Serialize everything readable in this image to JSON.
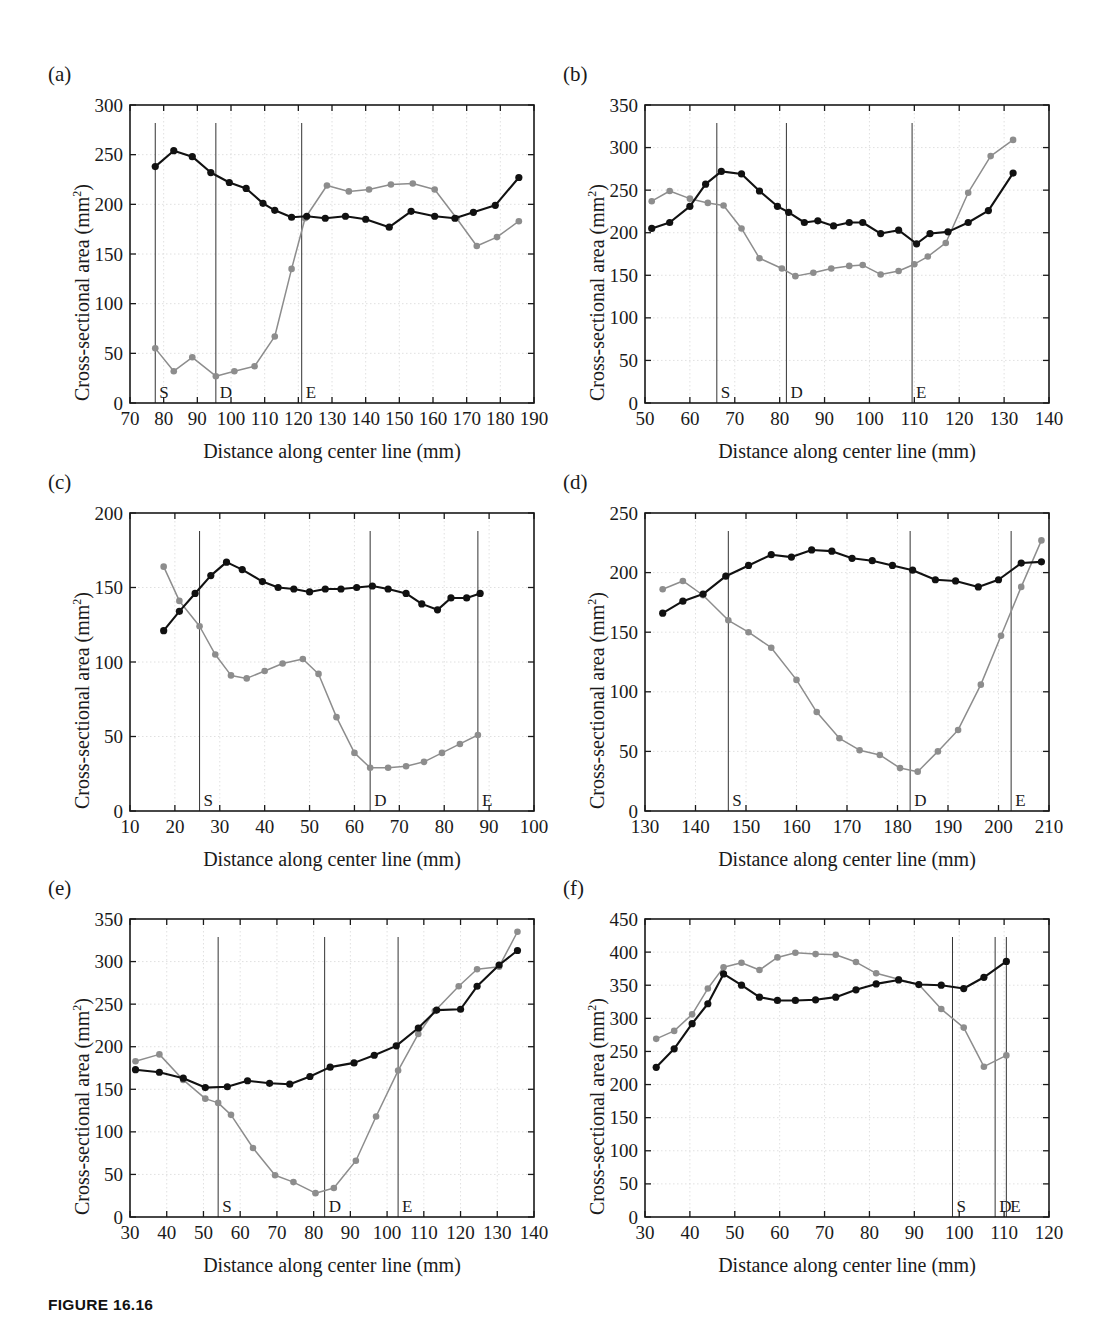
{
  "figure": {
    "caption": "FIGURE 16.16",
    "axis_title_x": "Distance along center line (mm)",
    "axis_title_y_main": "Cross-sectional area (mm",
    "axis_title_y_sup": "2",
    "axis_title_y_close": ")",
    "colors": {
      "series_black": "#111111",
      "series_gray": "#8d8d8d",
      "axis": "#1a1a1a",
      "grid": "#d8d8d8",
      "background": "#ffffff"
    },
    "marker_labels": {
      "start": "S",
      "disease": "D",
      "end": "E"
    }
  },
  "chart_data": [
    {
      "id": "a",
      "panel_label": "(a)",
      "type": "line",
      "title": "",
      "xlabel": "Distance along center line (mm)",
      "ylabel": "Cross-sectional area (mm2)",
      "xlim": [
        70,
        190
      ],
      "ylim": [
        0,
        300
      ],
      "xticks": [
        70,
        80,
        90,
        100,
        110,
        120,
        130,
        140,
        150,
        160,
        170,
        180,
        190
      ],
      "yticks": [
        0,
        50,
        100,
        150,
        200,
        250,
        300
      ],
      "grid": true,
      "legend": "none",
      "markers": [
        {
          "label": "S",
          "x": 77.5
        },
        {
          "label": "D",
          "x": 95.5
        },
        {
          "label": "E",
          "x": 121.0
        }
      ],
      "series": [
        {
          "name": "black",
          "color": "#111111",
          "x": [
            77.5,
            83.0,
            88.5,
            94.0,
            99.5,
            104.5,
            109.5,
            113.0,
            118.0,
            122.5,
            128.0,
            134.0,
            140.0,
            147.0,
            153.5,
            160.5,
            166.5,
            172.0,
            178.5,
            185.5
          ],
          "y": [
            238,
            254,
            248,
            232,
            222,
            216,
            201,
            194,
            187,
            188,
            186,
            188,
            185,
            177,
            193,
            188,
            186,
            192,
            199,
            227
          ]
        },
        {
          "name": "gray",
          "color": "#8d8d8d",
          "x": [
            77.5,
            83.0,
            88.5,
            95.5,
            101.0,
            107.0,
            113.0,
            118.0,
            122.0,
            128.5,
            135.0,
            141.0,
            147.5,
            154.0,
            160.5,
            167.0,
            173.0,
            179.0,
            185.5
          ],
          "y": [
            55,
            32,
            46,
            27,
            32,
            37,
            67,
            135,
            186,
            219,
            213,
            215,
            220,
            221,
            215,
            186,
            158,
            167,
            183
          ]
        }
      ]
    },
    {
      "id": "b",
      "panel_label": "(b)",
      "type": "line",
      "xlabel": "Distance along center line (mm)",
      "ylabel": "Cross-sectional area (mm2)",
      "xlim": [
        50,
        140
      ],
      "ylim": [
        0,
        350
      ],
      "xticks": [
        50,
        60,
        70,
        80,
        90,
        100,
        110,
        120,
        130,
        140
      ],
      "yticks": [
        0,
        50,
        100,
        150,
        200,
        250,
        300,
        350
      ],
      "grid": true,
      "legend": "none",
      "markers": [
        {
          "label": "S",
          "x": 66.0
        },
        {
          "label": "D",
          "x": 81.5
        },
        {
          "label": "E",
          "x": 109.5
        }
      ],
      "series": [
        {
          "name": "black",
          "color": "#111111",
          "x": [
            51.5,
            55.5,
            60.0,
            63.5,
            67.0,
            71.5,
            75.5,
            79.5,
            82.0,
            85.5,
            88.5,
            92.0,
            95.5,
            98.5,
            102.5,
            106.5,
            110.5,
            113.5,
            117.5,
            122.0,
            126.5,
            132.0
          ],
          "y": [
            205,
            212,
            231,
            257,
            272,
            269,
            249,
            231,
            224,
            212,
            214,
            208,
            212,
            212,
            199,
            203,
            187,
            199,
            201,
            212,
            226,
            270
          ]
        },
        {
          "name": "gray",
          "color": "#8d8d8d",
          "x": [
            51.5,
            55.5,
            60.0,
            64.0,
            67.5,
            71.5,
            75.5,
            80.5,
            83.5,
            87.5,
            91.5,
            95.5,
            98.5,
            102.5,
            106.5,
            110.0,
            113.0,
            117.0,
            122.0,
            127.0,
            132.0
          ],
          "y": [
            237,
            249,
            240,
            235,
            232,
            205,
            170,
            158,
            149,
            153,
            158,
            161,
            162,
            151,
            155,
            163,
            172,
            188,
            247,
            290,
            309
          ]
        }
      ]
    },
    {
      "id": "c",
      "panel_label": "(c)",
      "type": "line",
      "xlabel": "Distance along center line (mm)",
      "ylabel": "Cross-sectional area (mm2)",
      "xlim": [
        10,
        100
      ],
      "ylim": [
        0,
        200
      ],
      "xticks": [
        10,
        20,
        30,
        40,
        50,
        60,
        70,
        80,
        90,
        100
      ],
      "yticks": [
        0,
        50,
        100,
        150,
        200
      ],
      "grid": true,
      "legend": "none",
      "markers": [
        {
          "label": "S",
          "x": 25.5
        },
        {
          "label": "D",
          "x": 63.5
        },
        {
          "label": "E",
          "x": 87.5
        }
      ],
      "series": [
        {
          "name": "black",
          "color": "#111111",
          "x": [
            17.5,
            21.0,
            24.5,
            28.0,
            31.5,
            35.0,
            39.5,
            43.0,
            46.5,
            50.0,
            53.5,
            57.0,
            60.5,
            64.0,
            67.5,
            71.5,
            75.0,
            78.5,
            81.5,
            85.0,
            88.0
          ],
          "y": [
            121,
            134,
            146,
            158,
            167,
            162,
            154,
            150,
            149,
            147,
            149,
            149,
            150,
            151,
            149,
            146,
            139,
            135,
            143,
            143,
            146
          ]
        },
        {
          "name": "gray",
          "color": "#8d8d8d",
          "x": [
            17.5,
            21.0,
            25.5,
            29.0,
            32.5,
            36.0,
            40.0,
            44.0,
            48.5,
            52.0,
            56.0,
            60.0,
            63.5,
            67.5,
            71.5,
            75.5,
            79.5,
            83.5,
            87.5
          ],
          "y": [
            164,
            141,
            124,
            105,
            91,
            89,
            94,
            99,
            102,
            92,
            63,
            39,
            29,
            29,
            30,
            33,
            39,
            45,
            51
          ]
        }
      ]
    },
    {
      "id": "d",
      "panel_label": "(d)",
      "type": "line",
      "xlabel": "Distance along center line (mm)",
      "ylabel": "Cross-sectional area (mm2)",
      "xlim": [
        130,
        210
      ],
      "ylim": [
        0,
        250
      ],
      "xticks": [
        130,
        140,
        150,
        160,
        170,
        180,
        190,
        200,
        210
      ],
      "yticks": [
        0,
        50,
        100,
        150,
        200,
        250
      ],
      "grid": true,
      "legend": "none",
      "markers": [
        {
          "label": "S",
          "x": 146.5
        },
        {
          "label": "D",
          "x": 182.5
        },
        {
          "label": "E",
          "x": 202.5
        }
      ],
      "series": [
        {
          "name": "black",
          "color": "#111111",
          "x": [
            133.5,
            137.5,
            141.5,
            146.0,
            150.5,
            155.0,
            159.0,
            163.0,
            167.0,
            171.0,
            175.0,
            179.0,
            183.0,
            187.5,
            191.5,
            196.0,
            200.0,
            204.5,
            208.5
          ],
          "y": [
            166,
            176,
            182,
            197,
            206,
            215,
            213,
            219,
            218,
            212,
            210,
            206,
            202,
            194,
            193,
            188,
            194,
            208,
            209
          ]
        },
        {
          "name": "gray",
          "color": "#8d8d8d",
          "x": [
            133.5,
            137.5,
            141.5,
            146.5,
            150.5,
            155.0,
            160.0,
            164.0,
            168.5,
            172.5,
            176.5,
            180.5,
            184.0,
            188.0,
            192.0,
            196.5,
            200.5,
            204.5,
            208.5
          ],
          "y": [
            186,
            193,
            181,
            160,
            150,
            137,
            110,
            83,
            61,
            51,
            47,
            36,
            33,
            50,
            68,
            106,
            147,
            188,
            227
          ]
        }
      ]
    },
    {
      "id": "e",
      "panel_label": "(e)",
      "type": "line",
      "xlabel": "Distance along center line (mm)",
      "ylabel": "Cross-sectional area (mm2)",
      "xlim": [
        30,
        140
      ],
      "ylim": [
        0,
        350
      ],
      "xticks": [
        30,
        40,
        50,
        60,
        70,
        80,
        90,
        100,
        110,
        120,
        130,
        140
      ],
      "yticks": [
        0,
        50,
        100,
        150,
        200,
        250,
        300,
        350
      ],
      "grid": true,
      "legend": "none",
      "markers": [
        {
          "label": "S",
          "x": 54.0
        },
        {
          "label": "D",
          "x": 83.0
        },
        {
          "label": "E",
          "x": 103.0
        }
      ],
      "series": [
        {
          "name": "black",
          "color": "#111111",
          "x": [
            31.5,
            38.0,
            44.5,
            50.5,
            56.5,
            62.0,
            68.0,
            73.5,
            79.0,
            84.5,
            91.0,
            96.5,
            102.5,
            108.5,
            113.5,
            120.0,
            124.5,
            130.5,
            135.5
          ],
          "y": [
            173,
            170,
            163,
            152,
            153,
            160,
            157,
            156,
            165,
            176,
            181,
            190,
            201,
            222,
            243,
            244,
            271,
            296,
            313
          ]
        },
        {
          "name": "gray",
          "color": "#8d8d8d",
          "x": [
            31.5,
            38.0,
            44.5,
            50.5,
            54.0,
            57.5,
            63.5,
            69.5,
            74.5,
            80.5,
            85.5,
            91.5,
            97.0,
            103.0,
            108.5,
            113.0,
            119.5,
            124.5,
            130.5,
            135.5
          ],
          "y": [
            183,
            191,
            161,
            139,
            134,
            120,
            81,
            49,
            41,
            28,
            34,
            66,
            118,
            172,
            215,
            242,
            271,
            291,
            294,
            335
          ]
        }
      ]
    },
    {
      "id": "f",
      "panel_label": "(f)",
      "type": "line",
      "xlabel": "Distance along center line (mm)",
      "ylabel": "Cross-sectional area (mm2)",
      "xlim": [
        30,
        120
      ],
      "ylim": [
        0,
        450
      ],
      "xticks": [
        30,
        40,
        50,
        60,
        70,
        80,
        90,
        100,
        110,
        120
      ],
      "yticks": [
        0,
        50,
        100,
        150,
        200,
        250,
        300,
        350,
        400,
        450
      ],
      "grid": true,
      "legend": "none",
      "markers": [
        {
          "label": "S",
          "x": 98.5
        },
        {
          "label": "D",
          "x": 108.0
        },
        {
          "label": "E",
          "x": 110.5
        }
      ],
      "series": [
        {
          "name": "black",
          "color": "#111111",
          "x": [
            32.5,
            36.5,
            40.5,
            44.0,
            47.5,
            51.5,
            55.5,
            59.5,
            63.5,
            68.0,
            72.5,
            77.0,
            81.5,
            86.5,
            91.0,
            96.0,
            101.0,
            105.5,
            110.5
          ],
          "y": [
            226,
            254,
            292,
            322,
            367,
            350,
            332,
            327,
            327,
            328,
            332,
            343,
            352,
            358,
            351,
            350,
            345,
            362,
            386
          ]
        },
        {
          "name": "gray",
          "color": "#8d8d8d",
          "x": [
            32.5,
            36.5,
            40.5,
            44.0,
            47.5,
            51.5,
            55.5,
            59.5,
            63.5,
            68.0,
            72.5,
            77.0,
            81.5,
            86.5,
            91.0,
            96.0,
            101.0,
            105.5,
            110.5
          ],
          "y": [
            269,
            281,
            306,
            345,
            377,
            384,
            373,
            392,
            399,
            397,
            396,
            385,
            368,
            359,
            351,
            314,
            286,
            227,
            244
          ]
        }
      ]
    }
  ]
}
